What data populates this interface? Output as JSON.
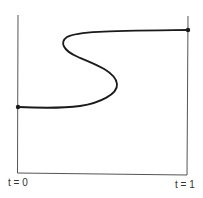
{
  "diagram": {
    "type": "path-homotopy-sketch",
    "labels": {
      "left": "t = 0",
      "right": "t = 1"
    },
    "frame": {
      "left_axis": {
        "x": 18,
        "y_top": 15,
        "y_bottom": 173
      },
      "right_axis": {
        "x": 188,
        "y_top": 16,
        "y_bottom": 175
      },
      "bottom_axis": {
        "y_left": 173,
        "y_right": 175
      }
    },
    "endpoints": [
      {
        "name": "start",
        "x": 18,
        "y": 107
      },
      {
        "name": "end",
        "x": 188,
        "y": 30
      }
    ],
    "colors": {
      "stroke": "#1a1a1a",
      "axis": "#555555",
      "background": "#ffffff"
    }
  }
}
